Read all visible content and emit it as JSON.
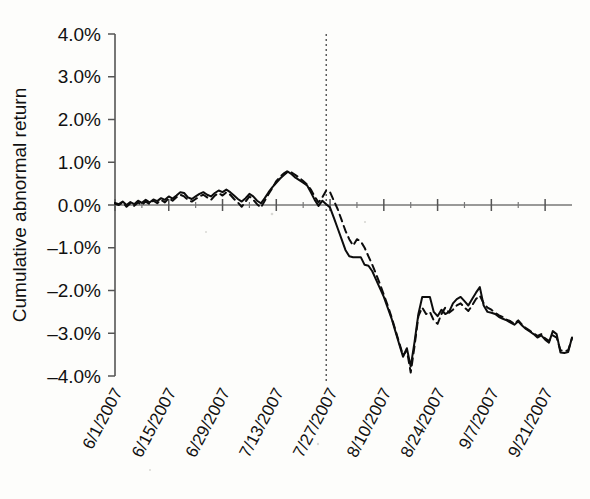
{
  "figure": {
    "background_color": "#fdfdfb",
    "ink_color": "#0d0d0d",
    "axis_color": "#555555"
  },
  "axes": {
    "y_title": "Cumulative abnormal return",
    "y_ticks": [
      "4.0%",
      "3.0%",
      "2.0%",
      "1.0%",
      "0.0%",
      "-1.0%",
      "-2.0%",
      "-3.0%",
      "-4.0%"
    ],
    "x_ticks": [
      "6/1/2007",
      "6/15/2007",
      "6/29/2007",
      "7/13/2007",
      "7/27/2007",
      "8/10/2007",
      "8/24/2007",
      "9/7/2007",
      "9/21/2007"
    ]
  },
  "annotations": {
    "event_line_label": "7/26/2007",
    "event_line_date_index": 55
  },
  "chart_data": {
    "type": "line",
    "title": "",
    "xlabel": "",
    "ylabel": "Cumulative abnormal return",
    "ylim": [
      -4.0,
      4.0
    ],
    "ytick_values": [
      4.0,
      3.0,
      2.0,
      1.0,
      0.0,
      -1.0,
      -2.0,
      -3.0,
      -4.0
    ],
    "xlim_dates": [
      "6/1/2007",
      "9/28/2007"
    ],
    "xtick_dates": [
      "6/1/2007",
      "6/15/2007",
      "6/29/2007",
      "7/13/2007",
      "7/27/2007",
      "8/10/2007",
      "8/24/2007",
      "9/7/2007",
      "9/21/2007"
    ],
    "xtick_day_offsets": [
      0,
      14,
      28,
      42,
      56,
      70,
      84,
      98,
      112
    ],
    "grid": false,
    "legend": false,
    "units": "percent",
    "annotation_vline_day_offset": 55,
    "series": [
      {
        "name": "solid",
        "style": "solid",
        "x_days": [
          0,
          1,
          2,
          3,
          4,
          5,
          6,
          7,
          8,
          9,
          10,
          11,
          12,
          13,
          14,
          15,
          16,
          17,
          18,
          19,
          20,
          21,
          22,
          23,
          24,
          25,
          26,
          27,
          28,
          29,
          30,
          31,
          32,
          33,
          34,
          35,
          36,
          37,
          38,
          39,
          40,
          41,
          42,
          43,
          44,
          45,
          46,
          47,
          48,
          49,
          50,
          51,
          52,
          53,
          54,
          55,
          56,
          57,
          58,
          59,
          60,
          61,
          62,
          63,
          64,
          65,
          66,
          67,
          68,
          69,
          70,
          71,
          72,
          73,
          74,
          75,
          76,
          77,
          78,
          79,
          80,
          81,
          82,
          83,
          84,
          85,
          86,
          87,
          88,
          89,
          90,
          91,
          92,
          93,
          94,
          95,
          96,
          97,
          98,
          99,
          100,
          101,
          102,
          103,
          104,
          105,
          106,
          107,
          108,
          109,
          110,
          111,
          112,
          113,
          114,
          115,
          116,
          117,
          118,
          119
        ],
        "values": [
          0.05,
          0.02,
          0.08,
          0.0,
          0.07,
          0.02,
          0.1,
          0.05,
          0.12,
          0.06,
          0.13,
          0.09,
          0.16,
          0.12,
          0.2,
          0.15,
          0.22,
          0.3,
          0.28,
          0.18,
          0.14,
          0.2,
          0.26,
          0.3,
          0.24,
          0.2,
          0.28,
          0.34,
          0.3,
          0.36,
          0.3,
          0.22,
          0.14,
          0.08,
          0.16,
          0.26,
          0.2,
          0.1,
          0.04,
          0.16,
          0.3,
          0.42,
          0.52,
          0.62,
          0.7,
          0.78,
          0.72,
          0.64,
          0.58,
          0.52,
          0.46,
          0.3,
          0.12,
          -0.02,
          0.1,
          0.02,
          -0.06,
          -0.3,
          -0.55,
          -0.8,
          -1.05,
          -1.2,
          -1.22,
          -1.22,
          -1.22,
          -1.4,
          -1.42,
          -1.55,
          -1.75,
          -1.95,
          -2.15,
          -2.4,
          -2.65,
          -2.95,
          -3.25,
          -3.55,
          -3.35,
          -3.78,
          -3.2,
          -2.55,
          -2.15,
          -2.15,
          -2.15,
          -2.5,
          -2.6,
          -2.45,
          -2.55,
          -2.5,
          -2.3,
          -2.2,
          -2.15,
          -2.25,
          -2.35,
          -2.2,
          -2.05,
          -1.92,
          -2.35,
          -2.5,
          -2.52,
          -2.55,
          -2.62,
          -2.66,
          -2.7,
          -2.75,
          -2.8,
          -2.72,
          -2.82,
          -2.9,
          -2.96,
          -3.02,
          -3.1,
          -3.05,
          -3.15,
          -3.22,
          -2.95,
          -3.02,
          -3.45,
          -3.46,
          -3.44,
          -3.1
        ]
      },
      {
        "name": "dashed",
        "style": "dashed",
        "x_days": [
          0,
          1,
          2,
          3,
          4,
          5,
          6,
          7,
          8,
          9,
          10,
          11,
          12,
          13,
          14,
          15,
          16,
          17,
          18,
          19,
          20,
          21,
          22,
          23,
          24,
          25,
          26,
          27,
          28,
          29,
          30,
          31,
          32,
          33,
          34,
          35,
          36,
          37,
          38,
          39,
          40,
          41,
          42,
          43,
          44,
          45,
          46,
          47,
          48,
          49,
          50,
          51,
          52,
          53,
          54,
          55,
          56,
          57,
          58,
          59,
          60,
          61,
          62,
          63,
          64,
          65,
          66,
          67,
          68,
          69,
          70,
          71,
          72,
          73,
          74,
          75,
          76,
          77,
          78,
          79,
          80,
          81,
          82,
          83,
          84,
          85,
          86,
          87,
          88,
          89,
          90,
          91,
          92,
          93,
          94,
          95,
          96,
          97,
          98,
          99,
          100,
          101,
          102,
          103,
          104,
          105,
          106,
          107,
          108,
          109,
          110,
          111,
          112,
          113,
          114,
          115,
          116,
          117,
          118,
          119
        ],
        "values": [
          0.03,
          0.0,
          0.06,
          -0.04,
          0.04,
          -0.02,
          0.06,
          0.0,
          0.08,
          0.02,
          0.1,
          0.04,
          0.12,
          0.06,
          0.16,
          0.1,
          0.18,
          0.24,
          0.2,
          0.12,
          0.08,
          0.14,
          0.2,
          0.24,
          0.18,
          0.12,
          0.22,
          0.28,
          0.22,
          0.3,
          0.24,
          0.14,
          0.06,
          -0.04,
          0.08,
          0.2,
          0.12,
          0.02,
          -0.06,
          0.1,
          0.26,
          0.4,
          0.56,
          0.66,
          0.74,
          0.8,
          0.76,
          0.7,
          0.64,
          0.56,
          0.48,
          0.36,
          0.2,
          0.06,
          0.18,
          0.34,
          0.3,
          0.1,
          -0.1,
          -0.35,
          -0.6,
          -0.8,
          -0.95,
          -0.8,
          -0.85,
          -1.0,
          -1.2,
          -1.4,
          -1.62,
          -1.85,
          -2.1,
          -2.35,
          -2.62,
          -2.92,
          -3.22,
          -3.52,
          -3.4,
          -3.92,
          -3.3,
          -2.6,
          -2.4,
          -2.55,
          -2.5,
          -2.7,
          -2.78,
          -2.55,
          -2.4,
          -2.52,
          -2.45,
          -2.35,
          -2.3,
          -2.4,
          -2.48,
          -2.35,
          -2.2,
          -2.12,
          -2.3,
          -2.4,
          -2.45,
          -2.52,
          -2.58,
          -2.62,
          -2.68,
          -2.72,
          -2.78,
          -2.7,
          -2.8,
          -2.88,
          -2.94,
          -3.0,
          -3.06,
          -3.02,
          -3.12,
          -3.18,
          -3.05,
          -3.1,
          -3.4,
          -3.42,
          -3.4,
          -3.12
        ]
      }
    ]
  }
}
